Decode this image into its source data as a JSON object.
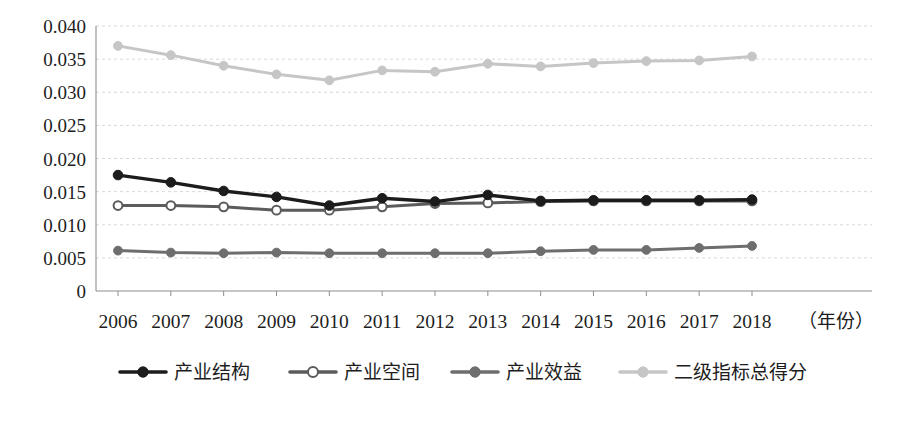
{
  "chart_data": {
    "type": "line",
    "title": "",
    "subtitle": "",
    "xlabel": "（年份）",
    "ylabel": "",
    "x": [
      2006,
      2007,
      2008,
      2009,
      2010,
      2011,
      2012,
      2013,
      2014,
      2015,
      2016,
      2017,
      2018
    ],
    "categories": [
      "2006",
      "2007",
      "2008",
      "2009",
      "2010",
      "2011",
      "2012",
      "2013",
      "2014",
      "2015",
      "2016",
      "2017",
      "2018"
    ],
    "xlim": [
      2006,
      2018
    ],
    "ylim": [
      0,
      0.04
    ],
    "ytick_labels": [
      "0.040",
      "0.035",
      "0.030",
      "0.025",
      "0.020",
      "0.015",
      "0.010",
      "0.005",
      "0"
    ],
    "ytick_values": [
      0.04,
      0.035,
      0.03,
      0.025,
      0.02,
      0.015,
      0.01,
      0.005,
      0
    ],
    "grid": true,
    "grid_axis": "y",
    "legend_position": "bottom",
    "series": [
      {
        "name": "产业结构",
        "color": "#1c1c1c",
        "marker": "filled-circle",
        "marker_fill": "#1c1c1c",
        "values": [
          0.0175,
          0.0164,
          0.0151,
          0.0142,
          0.0129,
          0.014,
          0.0135,
          0.0145,
          0.0136,
          0.0137,
          0.0137,
          0.0137,
          0.0138
        ]
      },
      {
        "name": "产业空间",
        "color": "#5b5b5b",
        "marker": "hollow-circle",
        "marker_fill": "#ffffff",
        "values": [
          0.0129,
          0.0129,
          0.0127,
          0.0122,
          0.0122,
          0.0127,
          0.0132,
          0.0133,
          0.0135,
          0.0136,
          0.0136,
          0.0136,
          0.0136
        ]
      },
      {
        "name": "产业效益",
        "color": "#6e6e6e",
        "marker": "filled-circle",
        "marker_fill": "#6e6e6e",
        "values": [
          0.0061,
          0.0058,
          0.0057,
          0.0058,
          0.0057,
          0.0057,
          0.0057,
          0.0057,
          0.006,
          0.0062,
          0.0062,
          0.0065,
          0.0068
        ]
      },
      {
        "name": "二级指标总得分",
        "color": "#c6c6c6",
        "marker": "filled-circle",
        "marker_fill": "#c6c6c6",
        "values": [
          0.037,
          0.0356,
          0.034,
          0.0327,
          0.0318,
          0.0333,
          0.0331,
          0.0343,
          0.0339,
          0.0344,
          0.0347,
          0.0348,
          0.0354
        ]
      }
    ]
  },
  "legend": {
    "items": [
      {
        "label": "产业结构"
      },
      {
        "label": "产业空间"
      },
      {
        "label": "产业效益"
      },
      {
        "label": "二级指标总得分"
      }
    ]
  },
  "axes": {
    "x_unit_label": "（年份）"
  },
  "colors": {
    "grid": "#d8d8d8",
    "axis": "#8d8d8d",
    "text": "#1d1d1d",
    "series_1": "#1c1c1c",
    "series_2": "#5b5b5b",
    "series_3": "#6e6e6e",
    "series_4": "#c6c6c6"
  }
}
